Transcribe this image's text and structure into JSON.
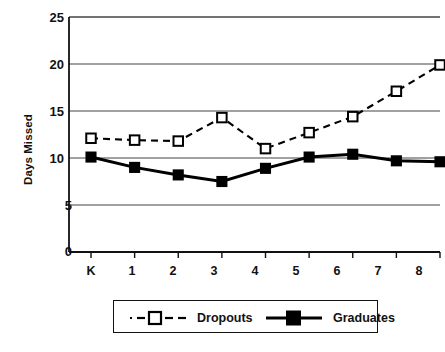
{
  "chart_data": {
    "type": "line",
    "title": "",
    "xlabel": "",
    "ylabel": "Days Missed",
    "categories": [
      "K",
      "1",
      "2",
      "3",
      "4",
      "5",
      "6",
      "7",
      "8"
    ],
    "ylim": [
      0,
      25
    ],
    "yticks": [
      0,
      5,
      10,
      15,
      20,
      25
    ],
    "ytick_labels": [
      "0",
      "5",
      "10",
      "15",
      "20",
      "25"
    ],
    "grid": "horizontal",
    "legend_position": "bottom",
    "series": [
      {
        "name": "Dropouts",
        "values": [
          12.1,
          11.9,
          11.8,
          14.3,
          11.0,
          12.7,
          14.4,
          17.1,
          19.9
        ],
        "line_style": "dashed",
        "marker": "open-square",
        "color": "#000000"
      },
      {
        "name": "Graduates",
        "values": [
          10.1,
          9.0,
          8.2,
          7.5,
          8.9,
          10.1,
          10.4,
          9.7,
          9.6
        ],
        "line_style": "solid",
        "marker": "filled-square",
        "color": "#000000"
      }
    ]
  },
  "axes": {
    "y_title": "Days Missed",
    "y_labels": [
      "25",
      "20",
      "15",
      "10",
      "5",
      "0"
    ],
    "x_labels": [
      "K",
      "1",
      "2",
      "3",
      "4",
      "5",
      "6",
      "7",
      "8"
    ]
  },
  "legend": {
    "items": [
      {
        "label": "Dropouts",
        "marker": "open-square-dashed"
      },
      {
        "label": "Graduates",
        "marker": "filled-square-solid"
      }
    ]
  },
  "colors": {
    "ink": "#111111",
    "grid": "#444444",
    "marker_fill_open": "#ffffff",
    "marker_fill_solid": "#000000"
  }
}
